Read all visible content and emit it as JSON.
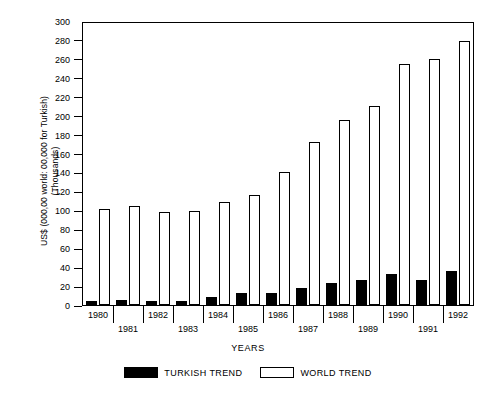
{
  "chart_data": {
    "type": "bar",
    "title": "",
    "xlabel": "YEARS",
    "ylabel": "US$ (000,00 world: 00,000 for Turkish) (Thousands)",
    "ylabel_line1": "US$ (000,00 world: 00,000 for Turkish)",
    "ylabel_line2": "(Thousands)",
    "categories": [
      "1980",
      "1981",
      "1982",
      "1983",
      "1984",
      "1985",
      "1986",
      "1987",
      "1988",
      "1989",
      "1990",
      "1991",
      "1992"
    ],
    "series": [
      {
        "name": "TURKISH TREND",
        "color": "#000000",
        "style": "filled",
        "values": [
          4,
          5,
          4,
          4,
          9,
          13,
          13,
          18,
          23,
          27,
          33,
          27,
          36
        ]
      },
      {
        "name": "WORLD TREND",
        "color": "#ffffff",
        "style": "hollow",
        "values": [
          102,
          105,
          99,
          100,
          110,
          117,
          141,
          173,
          197,
          212,
          256,
          262,
          281
        ]
      }
    ],
    "ylim": [
      0,
      300
    ],
    "ytick_step": 20,
    "ytick_labels": [
      "0",
      "20",
      "40",
      "60",
      "80",
      "100",
      "120",
      "140",
      "160",
      "180",
      "200",
      "220",
      "240",
      "260",
      "280",
      "300"
    ],
    "grid": false,
    "legend_position": "bottom"
  },
  "legend": {
    "items": [
      {
        "label": "TURKISH TREND",
        "style": "filled"
      },
      {
        "label": "WORLD TREND",
        "style": "hollow"
      }
    ]
  },
  "axes": {
    "x_title": "YEARS"
  }
}
